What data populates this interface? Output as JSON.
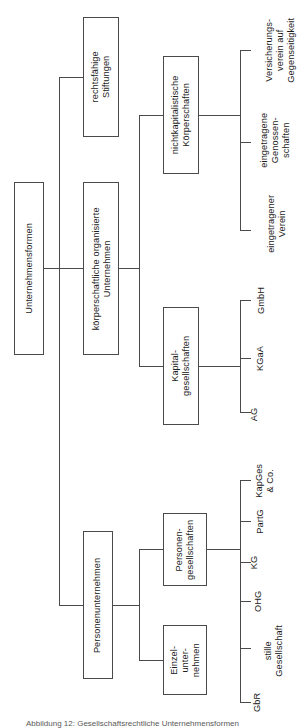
{
  "figure": {
    "orientation": "rotated-90-ccw",
    "caption": "Abbildung 12: Gesellschaftsrechtliche Unternehmensformen",
    "line_color": "#4a4a4a",
    "text_color": "#1c1c1c",
    "background": "#ffffff"
  },
  "tree": {
    "root": {
      "label": "Unternehmensformen"
    },
    "level2": [
      {
        "key": "rechtsfaehige_stiftungen",
        "label": "rechtsfähige\nStiftungen"
      },
      {
        "key": "koerperschaftliche",
        "label": "körperschaftliche organisierte\nUnternehmen"
      },
      {
        "key": "personenunternehmen",
        "label": "Personenunternehmen"
      }
    ],
    "level3": [
      {
        "key": "nichtkapitalistische",
        "label": "nichtkapitalistische\nKörperschaften",
        "parent": "koerperschaftliche"
      },
      {
        "key": "kapitalgesellschaften",
        "label": "Kapital-\ngesellschaften",
        "parent": "koerperschaftliche"
      },
      {
        "key": "personengesellschaften",
        "label": "Personen-\ngesellschaften",
        "parent": "personenunternehmen"
      },
      {
        "key": "einzelunternehmen",
        "label": "Einzel-\nunter-\nnehmen",
        "parent": "personenunternehmen"
      }
    ],
    "leaves": {
      "nichtkapitalistische": [
        {
          "label": "Versicherungs-\nverein auf\nGegenseitigkeit"
        },
        {
          "label": "eingetragene\nGenossen-\nschaften"
        },
        {
          "label": "eingetragener\nVerein"
        }
      ],
      "kapitalgesellschaften": [
        {
          "label": "GmbH"
        },
        {
          "label": "KGaA"
        },
        {
          "label": "AG"
        }
      ],
      "personengesellschaften": [
        {
          "label": "KapGes\n& Co."
        },
        {
          "label": "PartG"
        },
        {
          "label": "KG"
        },
        {
          "label": "OHG"
        },
        {
          "label": "stille\nGesellschaft"
        },
        {
          "label": "GbR"
        }
      ]
    }
  }
}
